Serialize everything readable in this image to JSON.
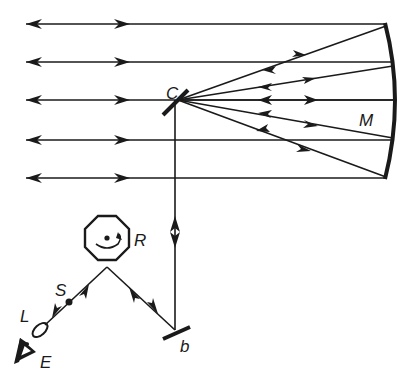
{
  "diagram": {
    "type": "optical setup (rotating-mirror speed-of-light apparatus)",
    "labels": {
      "concave_mirror": "M",
      "beam_splitter_mirror": "C",
      "rotating_mirror": "R",
      "plane_mirror": "b",
      "source": "S",
      "lens": "L",
      "eye": "E"
    },
    "colors": {
      "ink": "#1a1a1a",
      "background": "#ffffff"
    },
    "parallel_beams": [
      24,
      62,
      100,
      140,
      178
    ],
    "converging_rays": 5
  }
}
